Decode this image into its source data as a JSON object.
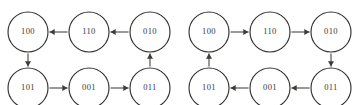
{
  "figure": {
    "background_color": "#ffffff",
    "node_stroke_color": "#33322f",
    "edge_color": "#3d3c38",
    "label_color": "#3a3935",
    "node_radius": 20,
    "graphs": [
      {
        "id": "graph-left",
        "cycle_direction": "counterclockwise",
        "nodes": [
          {
            "id": "g1-100",
            "label": "100",
            "cx": 28,
            "cy": 32,
            "row": "top",
            "col": "left"
          },
          {
            "id": "g1-110",
            "label": "110",
            "cx": 89,
            "cy": 32,
            "row": "top",
            "col": "center"
          },
          {
            "id": "g1-010",
            "label": "010",
            "cx": 150,
            "cy": 32,
            "row": "top",
            "col": "right"
          },
          {
            "id": "g1-101",
            "label": "101",
            "cx": 28,
            "cy": 88,
            "row": "bottom",
            "col": "left"
          },
          {
            "id": "g1-001",
            "label": "001",
            "cx": 89,
            "cy": 88,
            "row": "bottom",
            "col": "center"
          },
          {
            "id": "g1-011",
            "label": "011",
            "cx": 150,
            "cy": 88,
            "row": "bottom",
            "col": "right"
          }
        ],
        "edges": [
          {
            "id": "g1-e1",
            "from": "010",
            "to": "110",
            "direction": "left"
          },
          {
            "id": "g1-e2",
            "from": "110",
            "to": "100",
            "direction": "left"
          },
          {
            "id": "g1-e3",
            "from": "100",
            "to": "101",
            "direction": "down"
          },
          {
            "id": "g1-e4",
            "from": "101",
            "to": "001",
            "direction": "right"
          },
          {
            "id": "g1-e5",
            "from": "001",
            "to": "011",
            "direction": "right"
          },
          {
            "id": "g1-e6",
            "from": "011",
            "to": "010",
            "direction": "up"
          }
        ]
      },
      {
        "id": "graph-right",
        "cycle_direction": "clockwise",
        "nodes": [
          {
            "id": "g2-100",
            "label": "100",
            "cx": 209,
            "cy": 32,
            "row": "top",
            "col": "left"
          },
          {
            "id": "g2-110",
            "label": "110",
            "cx": 270,
            "cy": 32,
            "row": "top",
            "col": "center"
          },
          {
            "id": "g2-010",
            "label": "010",
            "cx": 331,
            "cy": 32,
            "row": "top",
            "col": "right"
          },
          {
            "id": "g2-101",
            "label": "101",
            "cx": 209,
            "cy": 88,
            "row": "bottom",
            "col": "left"
          },
          {
            "id": "g2-001",
            "label": "001",
            "cx": 270,
            "cy": 88,
            "row": "bottom",
            "col": "center"
          },
          {
            "id": "g2-011",
            "label": "011",
            "cx": 331,
            "cy": 88,
            "row": "bottom",
            "col": "right"
          }
        ],
        "edges": [
          {
            "id": "g2-e1",
            "from": "100",
            "to": "110",
            "direction": "right"
          },
          {
            "id": "g2-e2",
            "from": "110",
            "to": "010",
            "direction": "right"
          },
          {
            "id": "g2-e3",
            "from": "010",
            "to": "011",
            "direction": "down"
          },
          {
            "id": "g2-e4",
            "from": "011",
            "to": "001",
            "direction": "left"
          },
          {
            "id": "g2-e5",
            "from": "001",
            "to": "101",
            "direction": "left"
          },
          {
            "id": "g2-e6",
            "from": "101",
            "to": "100",
            "direction": "up"
          }
        ]
      }
    ]
  }
}
